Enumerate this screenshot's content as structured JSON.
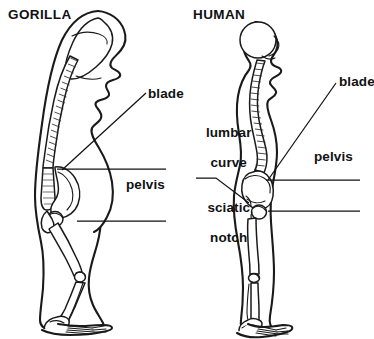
{
  "figure": {
    "type": "anatomical-comparison-diagram",
    "background_color": "#ffffff",
    "ink_color": "#111111"
  },
  "panels": [
    {
      "id": "gorilla",
      "title": "GORILLA",
      "title_position": {
        "x": 8,
        "y": 8
      },
      "labels": [
        {
          "name": "blade",
          "text": "blade",
          "x": 148,
          "y": 86,
          "align": "left",
          "leader": "diagonal line running down-left from label to the upper iliac blade of the pelvis"
        },
        {
          "name": "pelvis",
          "text": "pelvis",
          "x": 126,
          "y": 177,
          "align": "left",
          "leader": "two horizontal rules, one above and one below the label, pointing left toward the pelvis"
        }
      ]
    },
    {
      "id": "human",
      "title": "HUMAN",
      "title_position": {
        "x": 193,
        "y": 8
      },
      "labels": [
        {
          "name": "blade",
          "text": "blade",
          "x": 339,
          "y": 74,
          "align": "right",
          "leader": "diagonal line running down-left from label to the iliac blade"
        },
        {
          "name": "lumbar-curve",
          "text": "lumbar\ncurve",
          "line1": "lumbar",
          "line2": "curve",
          "x": 190,
          "y": 110,
          "align": "center",
          "leader": "none (text sits beside the lumbar region of the spine)"
        },
        {
          "name": "pelvis",
          "text": "pelvis",
          "x": 314,
          "y": 149,
          "align": "left",
          "leader": "two horizontal rules, one above and one below the label, pointing left toward the pelvis"
        },
        {
          "name": "sciatic-notch",
          "text": "sciatic\nnotch",
          "line1": "sciatic",
          "line2": "notch",
          "x": 192,
          "y": 185,
          "align": "center",
          "leader": "bent line going up and right from the label to the sciatic notch"
        }
      ]
    }
  ],
  "anatomy_terms": [
    "blade",
    "pelvis",
    "lumbar curve",
    "sciatic notch"
  ]
}
